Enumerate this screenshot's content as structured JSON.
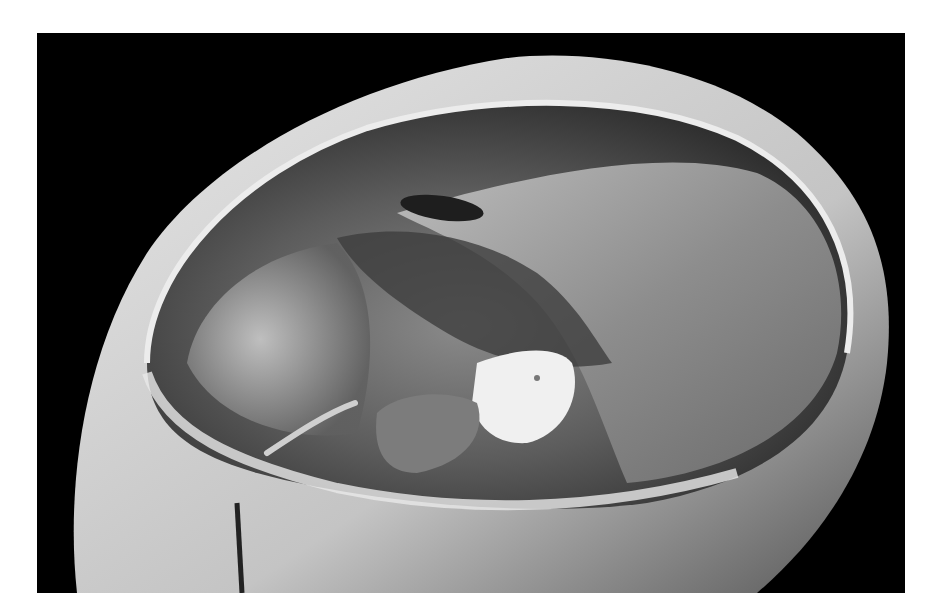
{
  "image": {
    "subject": "Dissected skull cavity with dura mater and brainstem cross-section",
    "colors": {
      "background": "#000000",
      "border": "#ffffff",
      "bone": "#d9d9d9",
      "membrane": "#a8a8a8",
      "cavity_dark": "#3a3a3a",
      "highlight": "#f2f2f2"
    }
  }
}
